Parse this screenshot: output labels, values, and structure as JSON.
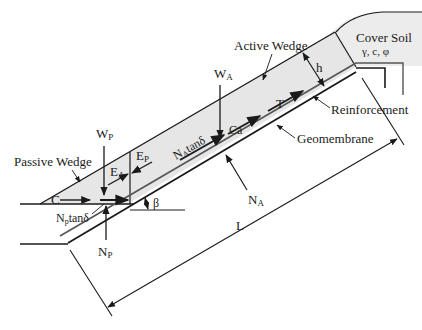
{
  "diagram": {
    "labels": {
      "cover_soil": "Cover Soil",
      "cover_soil_params": "γ, c, φ",
      "active_wedge": "Active Wedge",
      "passive_wedge": "Passive Wedge",
      "reinforcement": "Reinforcement",
      "geomembrane": "Geomembrane",
      "h": "h",
      "T": "T",
      "Ca": "Ca",
      "WA": "W",
      "WA_sub": "A",
      "WP": "W",
      "WP_sub": "P",
      "EA": "E",
      "EA_sub": "A",
      "EP": "E",
      "EP_sub": "P",
      "NA_tan": "N",
      "NA_tan_sub": "A",
      "NA_tan_rest": "tanδ",
      "NP_tan": "N",
      "NP_tan_sub": "p",
      "NP_tan_rest": "tanδ",
      "NA": "N",
      "NA_sub": "A",
      "NP": "N",
      "NP_sub": "P",
      "C": "C",
      "beta": "β",
      "L": "L"
    },
    "colors": {
      "soil_fill": "#e6e6e6",
      "line": "#1a1a1a",
      "reinforcement": "#555555"
    }
  }
}
